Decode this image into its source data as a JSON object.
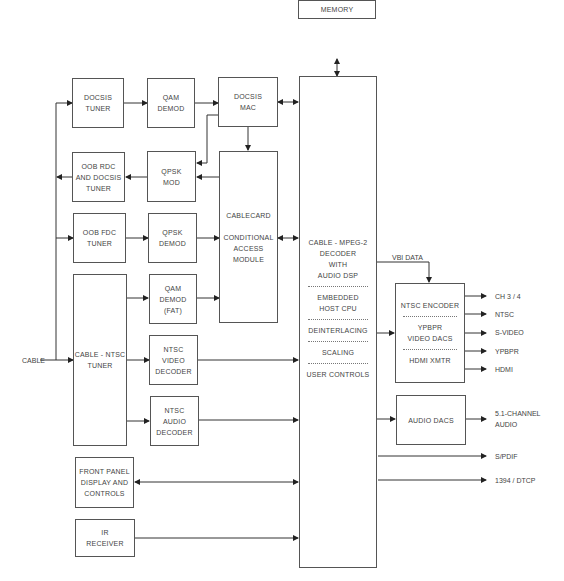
{
  "diagram": {
    "blocks": {
      "memory": [
        "MEMORY"
      ],
      "docsis_tuner": [
        "DOCSIS",
        "TUNER"
      ],
      "qam_demod": [
        "QAM",
        "DEMOD"
      ],
      "docsis_mac": [
        "DOCSIS",
        "MAC"
      ],
      "oob_rdc": [
        "OOB RDC",
        "AND DOCSIS",
        "TUNER"
      ],
      "qpsk_mod": [
        "QPSK",
        "MOD"
      ],
      "cablecard": [
        "CABLECARD",
        "CONDITIONAL",
        "ACCESS",
        "MODULE"
      ],
      "oob_fdc": [
        "OOB FDC",
        "TUNER"
      ],
      "qpsk_demod": [
        "QPSK",
        "DEMOD"
      ],
      "cable_ntsc_tuner": [
        "CABLE - NTSC",
        "TUNER"
      ],
      "qam_demod_fat": [
        "QAM",
        "DEMOD",
        "(FAT)"
      ],
      "ntsc_video_decoder": [
        "NTSC",
        "VIDEO",
        "DECODER"
      ],
      "ntsc_audio_decoder": [
        "NTSC",
        "AUDIO",
        "DECODER"
      ],
      "front_panel": [
        "FRONT PANEL",
        "DISPLAY AND",
        "CONTROLS"
      ],
      "ir_receiver": [
        "IR",
        "RECEIVER"
      ],
      "decoder": {
        "section1": [
          "CABLE - MPEG-2",
          "DECODER",
          "WITH",
          "AUDIO DSP"
        ],
        "section2": [
          "EMBEDDED",
          "HOST CPU"
        ],
        "section3": [
          "DEINTERLACING"
        ],
        "section4": [
          "SCALING"
        ],
        "section5": [
          "USER CONTROLS"
        ]
      },
      "encoder": {
        "section1": [
          "NTSC ENCODER"
        ],
        "section2": [
          "YPBPR",
          "VIDEO DACS"
        ],
        "section3": [
          "HDMI XMTR"
        ]
      },
      "audio_dacs": [
        "AUDIO DACS"
      ]
    },
    "labels": {
      "cable_input": "CABLE",
      "vbi_data": "VBI DATA",
      "outputs": [
        "CH 3 / 4",
        "NTSC",
        "S-VIDEO",
        "YPBPR",
        "HDMI"
      ],
      "audio_output": [
        "5.1-CHANNEL",
        "AUDIO"
      ],
      "spdif": "S/PDIF",
      "dtcp": "1394 / DTCP"
    }
  }
}
